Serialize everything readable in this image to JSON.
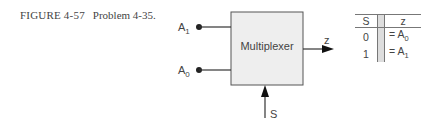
{
  "caption": {
    "figure": "FIGURE 4-57",
    "text": "Problem 4-35."
  },
  "diagram": {
    "block_label": "Multiplexer",
    "inputs": [
      {
        "name": "A",
        "sub": "1"
      },
      {
        "name": "A",
        "sub": "0"
      }
    ],
    "output": "z",
    "select": "S"
  },
  "truth_table": {
    "headers": [
      "S",
      "z"
    ],
    "rows": [
      {
        "s": "0",
        "z": "= A",
        "z_sub": "0"
      },
      {
        "s": "1",
        "z": "= A",
        "z_sub": "1"
      }
    ]
  }
}
